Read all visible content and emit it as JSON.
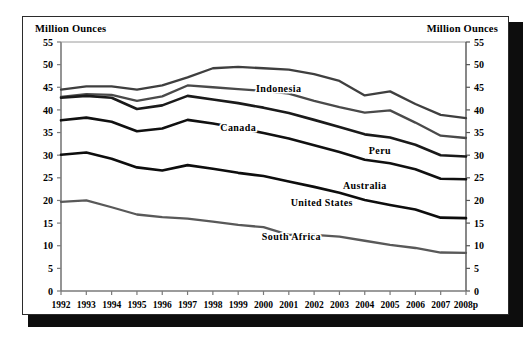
{
  "axis_titles": {
    "left": "Million Ounces",
    "right": "Million Ounces"
  },
  "chart_data": {
    "type": "line",
    "title": "",
    "xlabel": "",
    "ylabel": "Million Ounces",
    "ylabel_right": "Million Ounces",
    "grid": false,
    "legend": "inline-labels",
    "ylim": [
      0,
      55
    ],
    "yticks": [
      0,
      5,
      10,
      15,
      20,
      25,
      30,
      35,
      40,
      45,
      50,
      55
    ],
    "categories": [
      "1992",
      "1993",
      "1994",
      "1995",
      "1996",
      "1997",
      "1998",
      "1999",
      "2000",
      "2001",
      "2002",
      "2003",
      "2004",
      "2005",
      "2006",
      "2007",
      "2008p"
    ],
    "series": [
      {
        "name": "Indonesia",
        "color": "#3f3f3f",
        "width": 2.3,
        "label_x_index": 8.6,
        "label_y": 44.0,
        "values": [
          44.5,
          45.2,
          45.2,
          44.5,
          45.4,
          47.2,
          49.2,
          49.5,
          49.2,
          48.9,
          47.9,
          46.4,
          43.2,
          44.1,
          41.3,
          38.9,
          38.2
        ]
      },
      {
        "name": "Peru",
        "color": "#4a4a4a",
        "width": 2.3,
        "label_x_index": 12.6,
        "label_y": 30.2,
        "values": [
          42.9,
          43.5,
          43.3,
          42.0,
          43.0,
          45.4,
          45.0,
          44.6,
          44.2,
          43.6,
          42.0,
          40.6,
          39.4,
          39.9,
          37.2,
          34.3,
          33.8
        ]
      },
      {
        "name": "Canada",
        "color": "#1a1a1a",
        "width": 2.6,
        "label_x_index": 7.0,
        "label_y": 35.3,
        "values": [
          42.7,
          43.1,
          42.7,
          40.2,
          41.0,
          43.1,
          42.3,
          41.5,
          40.5,
          39.3,
          37.8,
          36.2,
          34.6,
          33.9,
          32.3,
          30.0,
          29.7
        ]
      },
      {
        "name": "Australia",
        "color": "#101010",
        "width": 2.6,
        "label_x_index": 12.0,
        "label_y": 22.6,
        "values": [
          37.7,
          38.3,
          37.4,
          35.3,
          35.9,
          37.8,
          37.0,
          36.0,
          34.9,
          33.7,
          32.2,
          30.7,
          29.0,
          28.2,
          26.9,
          24.8,
          24.7
        ]
      },
      {
        "name": "United States",
        "color": "#0d0d0d",
        "width": 2.6,
        "label_x_index": 10.3,
        "label_y": 18.8,
        "values": [
          30.1,
          30.6,
          29.2,
          27.3,
          26.6,
          27.8,
          27.0,
          26.1,
          25.4,
          24.2,
          23.0,
          21.7,
          20.1,
          19.0,
          18.0,
          16.2,
          16.1
        ]
      },
      {
        "name": "South Africa",
        "color": "#595959",
        "width": 2.3,
        "label_x_index": 9.1,
        "label_y": 11.2,
        "values": [
          19.7,
          20.0,
          18.5,
          16.9,
          16.3,
          16.0,
          15.3,
          14.6,
          14.1,
          12.4,
          12.4,
          12.0,
          11.1,
          10.2,
          9.5,
          8.5,
          8.4
        ]
      }
    ]
  }
}
